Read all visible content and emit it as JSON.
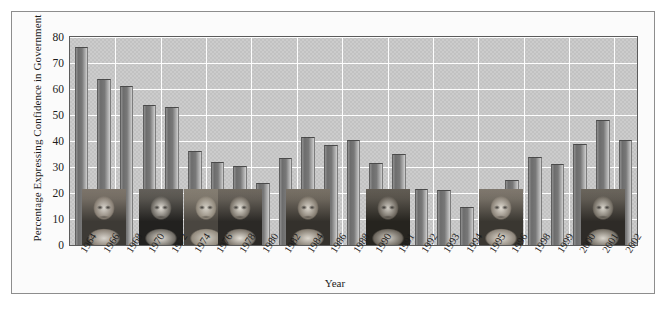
{
  "chart_data": {
    "type": "bar",
    "title": "",
    "xlabel": "Year",
    "ylabel": "Percentage Expressing Confidence in Government",
    "ylim": [
      0,
      80
    ],
    "ytick_labels": [
      "0",
      "10",
      "20",
      "30",
      "40",
      "50",
      "60",
      "70",
      "80"
    ],
    "ytick_values": [
      0,
      10,
      20,
      30,
      40,
      50,
      60,
      70,
      80
    ],
    "grid": "horizontal-and-vertical-white",
    "legend": "none",
    "categories": [
      "1964",
      "1966",
      "1968",
      "1970",
      "1972",
      "1974",
      "1976",
      "1978",
      "1980",
      "1982",
      "1984",
      "1986",
      "1988",
      "1990",
      "1991",
      "1992",
      "1993",
      "1994",
      "1995",
      "1996",
      "1998",
      "1999",
      "2000",
      "2001",
      "2002"
    ],
    "values": [
      76,
      64,
      61,
      54,
      53,
      36,
      32,
      30.5,
      24,
      33.5,
      41.5,
      38.5,
      40.5,
      31.5,
      35,
      21.5,
      21,
      14.5,
      21.5,
      25,
      34,
      31,
      39,
      48,
      40.5
    ],
    "series": [
      {
        "name": "Percentage Expressing Confidence in Government",
        "values": [
          76,
          64,
          61,
          54,
          53,
          36,
          32,
          30.5,
          24,
          33.5,
          41.5,
          38.5,
          40.5,
          31.5,
          35,
          21.5,
          21,
          14.5,
          21.5,
          25,
          34,
          31,
          39,
          48,
          40.5
        ]
      }
    ],
    "annotations": [
      {
        "name": "portrait-lyndon-johnson",
        "label": "Lyndon B. Johnson",
        "span_start": "1964",
        "span_end": "1968"
      },
      {
        "name": "portrait-richard-nixon",
        "label": "Richard Nixon",
        "span_start": "1968",
        "span_end": "1974"
      },
      {
        "name": "portrait-gerald-ford",
        "label": "Gerald Ford",
        "span_start": "1974",
        "span_end": "1976"
      },
      {
        "name": "portrait-jimmy-carter",
        "label": "Jimmy Carter",
        "span_start": "1976",
        "span_end": "1980"
      },
      {
        "name": "portrait-ronald-reagan",
        "label": "Ronald Reagan",
        "span_start": "1980",
        "span_end": "1988"
      },
      {
        "name": "portrait-george-hw-bush",
        "label": "George H. W. Bush",
        "span_start": "1988",
        "span_end": "1992"
      },
      {
        "name": "portrait-bill-clinton",
        "label": "Bill Clinton",
        "span_start": "1992",
        "span_end": "2000"
      },
      {
        "name": "portrait-george-w-bush",
        "label": "George W. Bush",
        "span_start": "2000",
        "span_end": "2002"
      }
    ],
    "colors": {
      "plot_background": "#c2c2c2",
      "gridline": "#fdfdfd",
      "bar_dark": "#6d6d6d",
      "bar_light": "#cfcfcf",
      "axis_line": "#5b5b5b",
      "frame": "#8d8d8d",
      "text": "#1c1c1c",
      "figure_background": "#fbfbfb"
    }
  }
}
